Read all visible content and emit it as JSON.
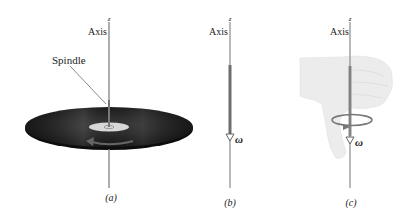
{
  "figure": {
    "panels": [
      {
        "id": "a",
        "caption": "(a)",
        "axis_label": "Axis",
        "axis_symbol": "z",
        "callout": "Spindle",
        "content": "spinning record disc on spindle with curved rotation arrow"
      },
      {
        "id": "b",
        "caption": "(b)",
        "axis_label": "Axis",
        "axis_symbol": "z",
        "vector_label": "ω",
        "content": "angular velocity vector pointing down along axis"
      },
      {
        "id": "c",
        "caption": "(c)",
        "axis_label": "Axis",
        "axis_symbol": "z",
        "vector_label": "ω",
        "content": "right-hand rule: thumb pointing down, fingers curling"
      }
    ],
    "colors": {
      "axis": "#8a8a8a",
      "disc": "#1c1c1c",
      "label_disc": "#d6d6d6",
      "vector": "#6e6e6e",
      "hand": "#ededed",
      "text": "#222222"
    }
  }
}
